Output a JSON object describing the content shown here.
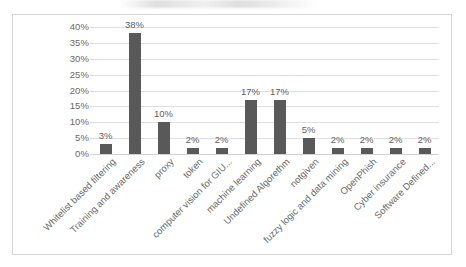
{
  "chart_data": {
    "type": "bar",
    "title": "",
    "xlabel": "",
    "ylabel": "",
    "ylim": [
      0,
      40
    ],
    "ytick_labels": [
      "40%",
      "35%",
      "30%",
      "25%",
      "20%",
      "15%",
      "10%",
      "5%",
      "0%"
    ],
    "ytick_values": [
      40,
      35,
      30,
      25,
      20,
      15,
      10,
      5,
      0
    ],
    "grid": true,
    "legend": "none",
    "bar_color": "#595959",
    "gridline_color": "#dfdfdf",
    "categories": [
      "Whitelist based filtering",
      "Training and awareness",
      "proxy",
      "token",
      "computer vision for GIU...",
      "machine learning",
      "Undefined Algorethm",
      "notgiven",
      "fuzzy logic and data mining",
      "OpenPhish",
      "Cyber insurance",
      "Software Defined..."
    ],
    "values": [
      3,
      38,
      10,
      2,
      2,
      17,
      17,
      5,
      2,
      2,
      2,
      2
    ],
    "data_labels": [
      "3%",
      "38%",
      "10%",
      "2%",
      "2%",
      "17%",
      "17%",
      "5%",
      "2%",
      "2%",
      "2%",
      "2%"
    ]
  }
}
